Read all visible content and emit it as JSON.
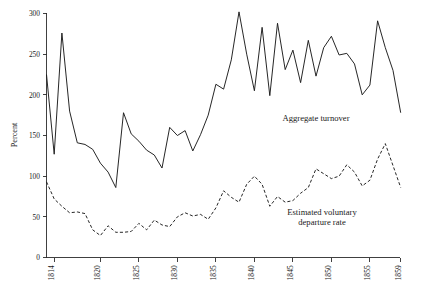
{
  "chart_data": {
    "type": "line",
    "title": "",
    "xlabel": "",
    "ylabel": "Percent",
    "xlim": [
      1813,
      1859
    ],
    "ylim": [
      0,
      300
    ],
    "ytick_values": [
      0,
      50,
      100,
      150,
      200,
      250,
      300
    ],
    "ytick_labels": [
      "0",
      "50",
      "100",
      "150",
      "200",
      "250",
      "300"
    ],
    "xtick_values": [
      1814,
      1820,
      1825,
      1830,
      1835,
      1840,
      1845,
      1850,
      1855,
      1859
    ],
    "xtick_labels": [
      "1814",
      "1820",
      "1825",
      "1830",
      "1835",
      "1840",
      "1845",
      "1850",
      "1855",
      "1859"
    ],
    "grid": false,
    "legend_position": "inline-annotation",
    "x": [
      1813,
      1814,
      1815,
      1816,
      1817,
      1818,
      1819,
      1820,
      1821,
      1822,
      1823,
      1824,
      1825,
      1826,
      1827,
      1828,
      1829,
      1830,
      1831,
      1832,
      1833,
      1834,
      1835,
      1836,
      1837,
      1838,
      1839,
      1840,
      1841,
      1842,
      1843,
      1844,
      1845,
      1846,
      1847,
      1848,
      1849,
      1850,
      1851,
      1852,
      1853,
      1854,
      1855,
      1856,
      1857,
      1858,
      1859
    ],
    "series": [
      {
        "name": "Aggregate turnover",
        "style": "solid",
        "annotation": "Aggregate turnover",
        "values": [
          225,
          127,
          276,
          180,
          141,
          139,
          133,
          116,
          105,
          86,
          178,
          152,
          143,
          132,
          126,
          110,
          160,
          150,
          156,
          131,
          151,
          175,
          213,
          207,
          243,
          302,
          250,
          205,
          283,
          199,
          288,
          231,
          255,
          215,
          267,
          223,
          258,
          272,
          249,
          251,
          238,
          200,
          212,
          291,
          258,
          230,
          178
        ]
      },
      {
        "name": "Estimated voluntary departure rate",
        "style": "dashed",
        "annotation": "Estimated voluntary\ndeparture rate",
        "values": [
          93,
          72,
          63,
          55,
          56,
          54,
          34,
          27,
          39,
          31,
          31,
          32,
          42,
          34,
          46,
          40,
          38,
          50,
          55,
          51,
          53,
          47,
          61,
          82,
          74,
          68,
          90,
          100,
          90,
          63,
          75,
          68,
          70,
          79,
          86,
          109,
          103,
          97,
          100,
          114,
          105,
          88,
          95,
          121,
          140,
          113,
          86
        ]
      }
    ],
    "annotations": [
      {
        "id": "aggregate-turnover-label",
        "text": "Aggregate turnover"
      },
      {
        "id": "departure-rate-label-line1",
        "text": "Estimated voluntary"
      },
      {
        "id": "departure-rate-label-line2",
        "text": "departure rate"
      }
    ]
  }
}
